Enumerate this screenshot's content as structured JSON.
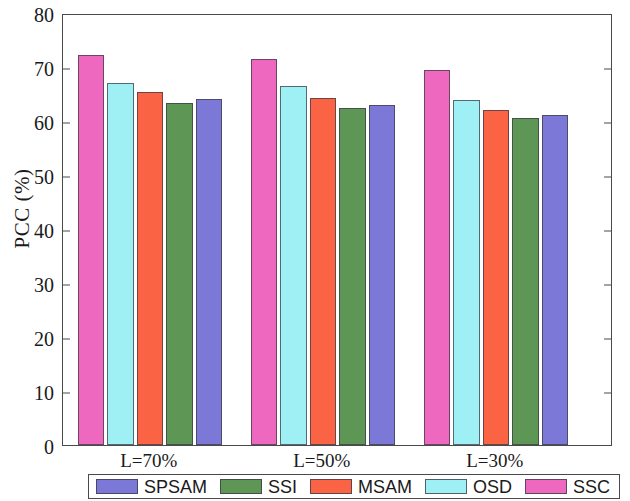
{
  "chart_data": {
    "type": "bar",
    "title": "",
    "xlabel": "",
    "ylabel": "PCC  (%)",
    "ylim": [
      0,
      80
    ],
    "yticks": [
      0,
      10,
      20,
      30,
      40,
      50,
      60,
      70,
      80
    ],
    "grid": false,
    "legend_position": "bottom",
    "categories": [
      "L=70%",
      "L=50%",
      "L=30%"
    ],
    "bar_order_in_group": [
      "SSC",
      "OSD",
      "MSAM",
      "SSI",
      "SPSAM"
    ],
    "series": [
      {
        "name": "SPSAM",
        "color": "#7b78d8",
        "values": [
          64.1,
          63.0,
          61.2
        ]
      },
      {
        "name": "SSI",
        "color": "#5e9655",
        "values": [
          63.4,
          62.4,
          60.6
        ]
      },
      {
        "name": "MSAM",
        "color": "#fa6445",
        "values": [
          65.3,
          64.3,
          62.1
        ]
      },
      {
        "name": "OSD",
        "color": "#9ff0f5",
        "values": [
          67.1,
          66.5,
          63.9
        ]
      },
      {
        "name": "SSC",
        "color": "#ee68c0",
        "values": [
          72.2,
          71.5,
          69.4
        ]
      }
    ]
  },
  "axis": {
    "y_tick_labels": [
      "0",
      "10",
      "20",
      "30",
      "40",
      "50",
      "60",
      "70",
      "80"
    ],
    "y_title": "PCC  (%)"
  },
  "groups": [
    {
      "label": "L=70%"
    },
    {
      "label": "L=50%"
    },
    {
      "label": "L=30%"
    }
  ],
  "legend": {
    "entries": [
      {
        "label": "SPSAM",
        "color": "#7b78d8"
      },
      {
        "label": "SSI",
        "color": "#5e9655"
      },
      {
        "label": "MSAM",
        "color": "#fa6445"
      },
      {
        "label": "OSD",
        "color": "#9ff0f5"
      },
      {
        "label": "SSC",
        "color": "#ee68c0"
      }
    ]
  }
}
